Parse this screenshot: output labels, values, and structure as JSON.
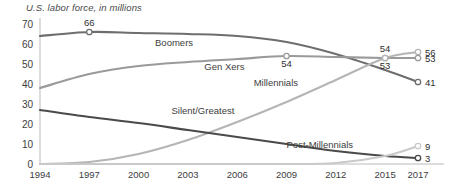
{
  "chart_data": {
    "type": "line",
    "title": "U.S. labor force, in millions",
    "xlabel": "",
    "ylabel": "",
    "ylim": [
      0,
      70
    ],
    "yticks": [
      0,
      10,
      20,
      30,
      40,
      50,
      60,
      70
    ],
    "grid": false,
    "legend": "inline-labels",
    "x": [
      1994,
      1997,
      2000,
      2003,
      2006,
      2009,
      2012,
      2015,
      2017
    ],
    "categories": [
      "1994",
      "1997",
      "2000",
      "2003",
      "2006",
      "2009",
      "2012",
      "2015",
      "2017"
    ],
    "series": [
      {
        "name": "Boomers",
        "color": "#6e6e6e",
        "values": [
          64.0,
          66.0,
          65.5,
          65.0,
          64.0,
          61.0,
          55.0,
          47.0,
          41.0
        ],
        "label_x": 2001,
        "label_y": 59
      },
      {
        "name": "Gen Xers",
        "color": "#9a9a9a",
        "values": [
          38.0,
          45.0,
          49.0,
          51.0,
          52.5,
          54.0,
          53.5,
          53.0,
          53.0
        ],
        "label_x": 2004,
        "label_y": 47
      },
      {
        "name": "Millennials",
        "color": "#b5b5b5",
        "values": [
          0.0,
          1.0,
          5.0,
          12.0,
          21.0,
          31.0,
          42.0,
          53.0,
          56.0
        ],
        "label_x": 2007,
        "label_y": 39
      },
      {
        "name": "Silent/Greatest",
        "color": "#4a4a4a",
        "values": [
          27.0,
          23.5,
          20.5,
          17.0,
          13.5,
          10.0,
          6.5,
          4.0,
          3.0
        ],
        "label_x": 2002,
        "label_y": 25
      },
      {
        "name": "Post-Millennials",
        "color": "#c9c9c9",
        "values": [
          0.0,
          0.0,
          0.0,
          0.0,
          0.0,
          0.0,
          0.5,
          4.0,
          9.0
        ],
        "label_x": 2009,
        "label_y": 8
      }
    ],
    "annotations": [
      {
        "text": "66",
        "series": "Boomers",
        "x": 1997,
        "y": 66,
        "marker": true,
        "pos": "above"
      },
      {
        "text": "54",
        "series": "Gen Xers",
        "x": 2009,
        "y": 54,
        "marker": true,
        "pos": "below"
      },
      {
        "text": "54",
        "series": "Gen Xers",
        "x": 2015,
        "y": 53,
        "marker": true,
        "pos": "above"
      },
      {
        "text": "53",
        "series": "Millennials",
        "x": 2015,
        "y": 53,
        "marker": true,
        "pos": "below"
      },
      {
        "text": "56",
        "series": "Millennials",
        "x": 2017,
        "y": 56,
        "marker": true,
        "pos": "right"
      },
      {
        "text": "53",
        "series": "Gen Xers",
        "x": 2017,
        "y": 53,
        "marker": true,
        "pos": "right"
      },
      {
        "text": "41",
        "series": "Boomers",
        "x": 2017,
        "y": 41,
        "marker": true,
        "pos": "right"
      },
      {
        "text": "9",
        "series": "Post-Millennials",
        "x": 2017,
        "y": 9,
        "marker": true,
        "pos": "right"
      },
      {
        "text": "3",
        "series": "Silent/Greatest",
        "x": 2017,
        "y": 3,
        "marker": true,
        "pos": "right"
      }
    ]
  }
}
